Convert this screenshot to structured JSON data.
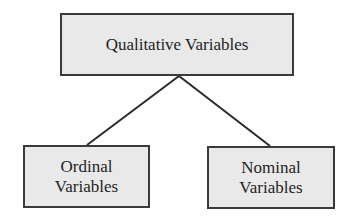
{
  "diagram": {
    "type": "tree",
    "colors": {
      "node_fill": "#e9e9e9",
      "node_border": "#3a3a3a",
      "connector": "#2a2a2a",
      "text": "#1f1f1f",
      "background": "#ffffff"
    },
    "root": {
      "label": "Qualitative Variables"
    },
    "children": [
      {
        "label_line1": "Ordinal",
        "label_line2": "Variables"
      },
      {
        "label_line1": "Nominal",
        "label_line2": "Variables"
      }
    ],
    "edges": [
      {
        "from": "Qualitative Variables",
        "to": "Ordinal Variables"
      },
      {
        "from": "Qualitative Variables",
        "to": "Nominal Variables"
      }
    ]
  }
}
